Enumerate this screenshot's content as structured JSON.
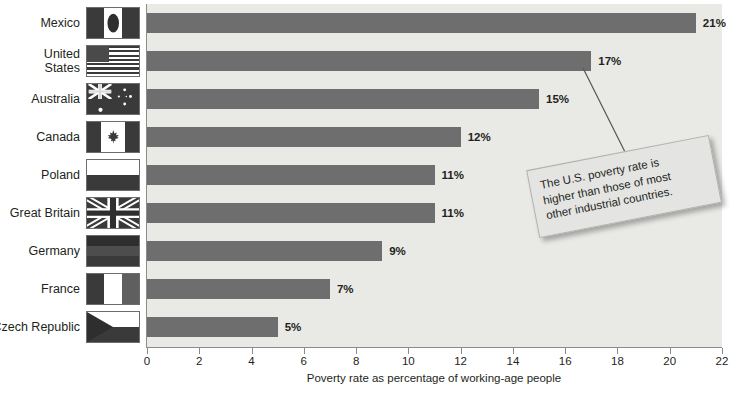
{
  "chart_data": {
    "type": "bar",
    "orientation": "horizontal",
    "title": "",
    "xlabel": "Poverty rate as percentage of working-age people",
    "ylabel": "",
    "xlim": [
      0,
      22
    ],
    "xticks": [
      0,
      2,
      4,
      6,
      8,
      10,
      12,
      14,
      16,
      18,
      20,
      22
    ],
    "grid": false,
    "legend": null,
    "categories": [
      "Mexico",
      "United States",
      "Australia",
      "Canada",
      "Poland",
      "Great Britain",
      "Germany",
      "France",
      "Czech Republic"
    ],
    "values": [
      21,
      17,
      15,
      12,
      11,
      11,
      9,
      7,
      5
    ],
    "value_labels": [
      "21%",
      "17%",
      "15%",
      "12%",
      "11%",
      "11%",
      "9%",
      "7%",
      "5%"
    ],
    "annotations": [
      {
        "text": "The U.S. poverty rate is higher than those of most other industrial countries.",
        "points_to": "United States"
      }
    ]
  },
  "rows": [
    {
      "label_line1": "Mexico",
      "label_line2": "",
      "value": 21,
      "value_label": "21%",
      "flag": "flag-mexico"
    },
    {
      "label_line1": "United",
      "label_line2": "States",
      "value": 17,
      "value_label": "17%",
      "flag": "flag-united-states"
    },
    {
      "label_line1": "Australia",
      "label_line2": "",
      "value": 15,
      "value_label": "15%",
      "flag": "flag-australia"
    },
    {
      "label_line1": "Canada",
      "label_line2": "",
      "value": 12,
      "value_label": "12%",
      "flag": "flag-canada"
    },
    {
      "label_line1": "Poland",
      "label_line2": "",
      "value": 11,
      "value_label": "11%",
      "flag": "flag-poland"
    },
    {
      "label_line1": "Great Britain",
      "label_line2": "",
      "value": 11,
      "value_label": "11%",
      "flag": "flag-great-britain"
    },
    {
      "label_line1": "Germany",
      "label_line2": "",
      "value": 9,
      "value_label": "9%",
      "flag": "flag-germany"
    },
    {
      "label_line1": "France",
      "label_line2": "",
      "value": 7,
      "value_label": "7%",
      "flag": "flag-france"
    },
    {
      "label_line1": "Czech Republic",
      "label_line2": "",
      "value": 5,
      "value_label": "5%",
      "flag": "flag-czech-republic"
    }
  ],
  "axis": {
    "title": "Poverty rate as percentage of working-age people",
    "ticks": [
      "0",
      "2",
      "4",
      "6",
      "8",
      "10",
      "12",
      "14",
      "16",
      "18",
      "20",
      "22"
    ]
  },
  "callout": {
    "line1": "The U.S. poverty rate is",
    "line2": "higher than those of most",
    "line3": "other industrial countries."
  },
  "colors": {
    "bar": "#6e6e6e",
    "plot_background": "#e9e9e6",
    "page_background": "#ffffff",
    "axis": "#8b8b8b",
    "text": "#231f20",
    "callout_background": "#e4e4e2"
  }
}
